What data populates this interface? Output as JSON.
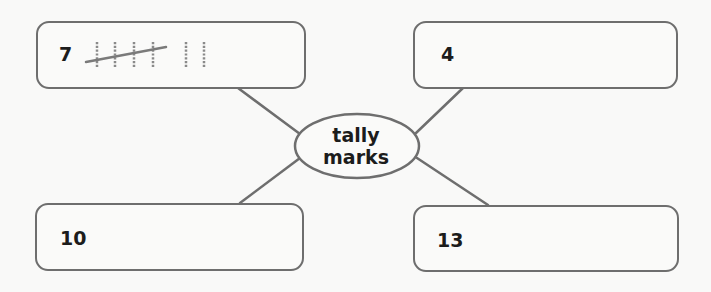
{
  "diagram": {
    "type": "concept-web",
    "center": {
      "label_line1": "tally",
      "label_line2": "marks"
    },
    "nodes": [
      {
        "position": "top-left",
        "number": "7",
        "tally": {
          "groups_of_five": 1,
          "singles": 2,
          "shown": true
        }
      },
      {
        "position": "top-right",
        "number": "4",
        "tally": {
          "shown": false
        }
      },
      {
        "position": "bottom-left",
        "number": "10",
        "tally": {
          "shown": false
        }
      },
      {
        "position": "bottom-right",
        "number": "13",
        "tally": {
          "shown": false
        }
      }
    ]
  },
  "colors": {
    "stroke": "#6e6e6e",
    "text": "#1c1c1c",
    "tally": "#8a8a8a",
    "background": "#f9f9f8"
  }
}
